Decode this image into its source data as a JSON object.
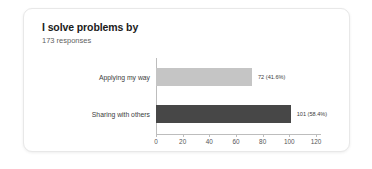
{
  "card": {
    "title": "I solve problems by",
    "subtitle": "173 responses"
  },
  "colors": {
    "background": "#ffffff",
    "card_background": "#ffffff",
    "card_border": "#e8e8e8",
    "title_text": "#1b1b1b",
    "subtitle_text": "#5f5f5f",
    "axis": "#bdbdbd",
    "bar_light": "#c5c5c5",
    "bar_dark": "#474747"
  },
  "chart_data": {
    "type": "bar",
    "orientation": "horizontal",
    "title": "I solve problems by",
    "subtitle": "173 responses",
    "total_responses": 173,
    "categories": [
      "Applying my way",
      "Sharing with others"
    ],
    "values": [
      72,
      101
    ],
    "percentages": [
      41.6,
      58.4
    ],
    "data_labels": [
      "72 (41.6%)",
      "101 (58.4%)"
    ],
    "bar_colors": [
      "#c5c5c5",
      "#474747"
    ],
    "xlabel": "",
    "ylabel": "",
    "xlim": [
      0,
      120
    ],
    "xticks": [
      0,
      20,
      40,
      60,
      80,
      100,
      120
    ],
    "xtick_labels": [
      "0",
      "20",
      "40",
      "60",
      "80",
      "100",
      "120"
    ],
    "grid": false,
    "legend": false
  }
}
